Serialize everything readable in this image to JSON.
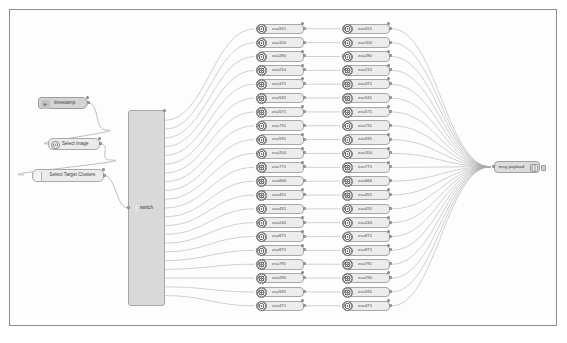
{
  "app": {
    "name": "node-red-flow-editor",
    "canvas_background": "#fdfdfd",
    "frame_border_color": "#8d8d8d",
    "wire_color": "#a9a9a9",
    "node_fill": "#e4e4e4",
    "node_border": "#a5a5a5"
  },
  "source_nodes": [
    {
      "id": "inject",
      "label": "timestamp",
      "icon": "inject-arrow-icon",
      "type": "inject"
    },
    {
      "id": "select_image",
      "label": "Select image",
      "icon": "gear-circle-icon",
      "type": "function"
    },
    {
      "id": "select_target_clusters",
      "label": "Select Target Clusters",
      "icon": "function-icon",
      "type": "function"
    }
  ],
  "switch_node": {
    "label": "switch",
    "icon": "switch-icon"
  },
  "cluster_column_left": [
    {
      "label": "zuu551",
      "icon": "cluster-icon"
    },
    {
      "label": "zuu100",
      "icon": "cluster-icon"
    },
    {
      "label": "zuu280",
      "icon": "cluster-icon"
    },
    {
      "label": "zuu210",
      "icon": "cluster-icon"
    },
    {
      "label": "zuu371",
      "icon": "cluster-icon"
    },
    {
      "label": "zuu531",
      "icon": "cluster-icon"
    },
    {
      "label": "zuu571",
      "icon": "cluster-icon"
    },
    {
      "label": "zuu731",
      "icon": "cluster-icon"
    },
    {
      "label": "zuu591",
      "icon": "cluster-icon"
    },
    {
      "label": "zuu200",
      "icon": "cluster-icon"
    },
    {
      "label": "zuu771",
      "icon": "cluster-icon"
    },
    {
      "label": "zuu666",
      "icon": "cluster-icon"
    },
    {
      "label": "zuu451",
      "icon": "cluster-icon"
    },
    {
      "label": "zuu431",
      "icon": "cluster-icon"
    },
    {
      "label": "zuu240",
      "icon": "cluster-icon"
    },
    {
      "label": "zuu871",
      "icon": "cluster-icon"
    },
    {
      "label": "zuu871",
      "icon": "cluster-icon"
    },
    {
      "label": "zuu791",
      "icon": "cluster-icon"
    },
    {
      "label": "zuu290",
      "icon": "cluster-icon"
    },
    {
      "label": "zuu591",
      "icon": "cluster-icon"
    },
    {
      "label": "zuu471",
      "icon": "cluster-icon"
    }
  ],
  "cluster_column_right": [
    {
      "label": "zuu551",
      "icon": "cluster-icon"
    },
    {
      "label": "zuu100",
      "icon": "cluster-icon"
    },
    {
      "label": "zuu280",
      "icon": "cluster-icon"
    },
    {
      "label": "zuu210",
      "icon": "cluster-icon"
    },
    {
      "label": "zuu371",
      "icon": "cluster-icon"
    },
    {
      "label": "zuu531",
      "icon": "cluster-icon"
    },
    {
      "label": "zuu571",
      "icon": "cluster-icon"
    },
    {
      "label": "zuu731",
      "icon": "cluster-icon"
    },
    {
      "label": "zuu591",
      "icon": "cluster-icon"
    },
    {
      "label": "zuu200",
      "icon": "cluster-icon"
    },
    {
      "label": "zuu771",
      "icon": "cluster-icon"
    },
    {
      "label": "zuu666",
      "icon": "cluster-icon"
    },
    {
      "label": "zuu451",
      "icon": "cluster-icon"
    },
    {
      "label": "zuu431",
      "icon": "cluster-icon"
    },
    {
      "label": "zuu240",
      "icon": "cluster-icon"
    },
    {
      "label": "zuu871",
      "icon": "cluster-icon"
    },
    {
      "label": "zuu871",
      "icon": "cluster-icon"
    },
    {
      "label": "zuu791",
      "icon": "cluster-icon"
    },
    {
      "label": "zuu290",
      "icon": "cluster-icon"
    },
    {
      "label": "zuu591",
      "icon": "cluster-icon"
    },
    {
      "label": "zuu471",
      "icon": "cluster-icon"
    }
  ],
  "sink_node": {
    "label": "msg payload",
    "icon": "debug-icon"
  }
}
